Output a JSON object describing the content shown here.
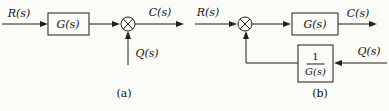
{
  "figure": {
    "colors": {
      "background": "#fbfbf8",
      "line": "#1f1f1f"
    }
  },
  "diagram_a": {
    "input_label": "R(s)",
    "block_label": "G(s)",
    "output_label": "C(s)",
    "disturbance_label": "Q(s)",
    "caption": "(a)"
  },
  "diagram_b": {
    "input_label": "R(s)",
    "block_label": "G(s)",
    "output_label": "C(s)",
    "disturbance_label": "Q(s)",
    "inverse_block_numerator": "1",
    "inverse_block_denominator": "G(s)",
    "caption": "(b)"
  }
}
